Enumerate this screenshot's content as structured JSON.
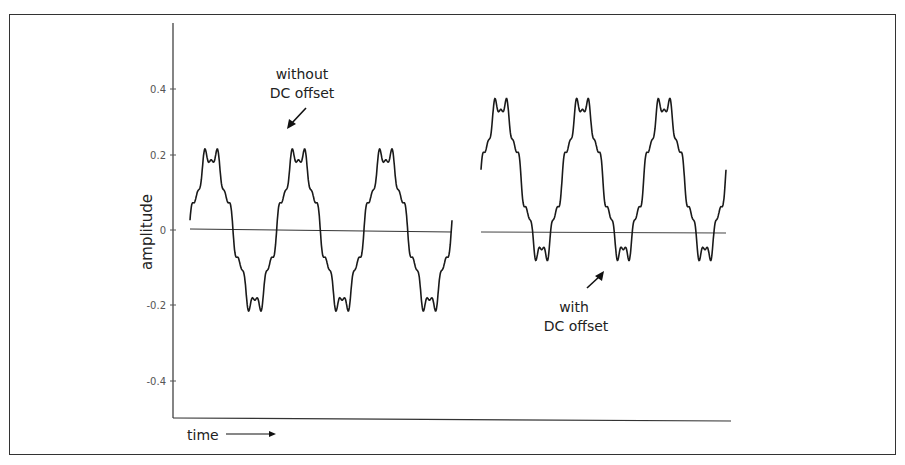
{
  "chart_data": {
    "type": "line",
    "title": "",
    "xlabel": "time",
    "ylabel": "amplitude",
    "ylim": [
      -0.5,
      0.55
    ],
    "yticks": [
      0.4,
      0.2,
      0,
      -0.2,
      -0.4
    ],
    "ytick_labels": [
      "0.4",
      "0.2",
      "0",
      "-0.2",
      "-0.4"
    ],
    "grid": false,
    "legend": null,
    "series": [
      {
        "name": "without DC offset",
        "description": "fundamental sine with small high-frequency ripple, centered on zero",
        "cycles": 3,
        "dc_offset": 0.0,
        "peak": 0.24,
        "trough": -0.22,
        "baseline": 0
      },
      {
        "name": "with DC offset",
        "description": "same waveform shifted upward by a DC offset",
        "cycles": 3,
        "dc_offset": 0.14,
        "peak": 0.38,
        "trough": -0.1,
        "baseline": 0
      }
    ],
    "annotations": [
      {
        "text_lines": [
          "without",
          "DC offset"
        ],
        "arrow": "points down-left toward first wave"
      },
      {
        "text_lines": [
          "with",
          "DC offset"
        ],
        "arrow": "points up-right toward second wave"
      }
    ]
  },
  "axes": {
    "y_label": "amplitude",
    "x_label": "time",
    "x_arrow": "→"
  },
  "annotations": {
    "without_line1": "without",
    "without_line2": "DC offset",
    "with_line1": "with",
    "with_line2": "DC offset"
  },
  "ticks": {
    "t0": "0.4",
    "t1": "0.2",
    "t2": "0",
    "t3": "-0.2",
    "t4": "-0.4"
  }
}
